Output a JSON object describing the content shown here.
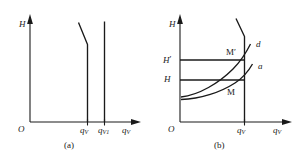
{
  "figure": {
    "panels": [
      {
        "id": "a",
        "caption": "(a)",
        "axes": {
          "y_label": "H",
          "x_label_symbol": "q",
          "x_label_sub": "V",
          "origin_label": "O"
        },
        "ticks": [
          {
            "symbol": "q",
            "sub": "V"
          },
          {
            "symbol": "q",
            "sub": "V1"
          }
        ],
        "curves": [
          {
            "name": "throttled-characteristic",
            "shape": "vertical-with-slanted-top"
          },
          {
            "name": "vertical-characteristic",
            "shape": "vertical"
          }
        ]
      },
      {
        "id": "b",
        "caption": "(b)",
        "axes": {
          "y_label": "H",
          "x_label_symbol": "q",
          "x_label_sub": "V",
          "origin_label": "O"
        },
        "ticks": [
          {
            "symbol": "q",
            "sub": "V"
          }
        ],
        "levels": [
          {
            "symbol": "H",
            "prime": "′"
          },
          {
            "symbol": "H",
            "prime": ""
          }
        ],
        "curve_labels": [
          {
            "name": "curve-d",
            "text": "d"
          },
          {
            "name": "curve-a",
            "text": "a"
          }
        ],
        "points": [
          {
            "name": "point-m-prime",
            "text": "M′"
          },
          {
            "name": "point-m",
            "text": "M"
          }
        ]
      }
    ],
    "colors": {
      "ink": "#1a1a1a",
      "background": "#ffffff"
    }
  }
}
